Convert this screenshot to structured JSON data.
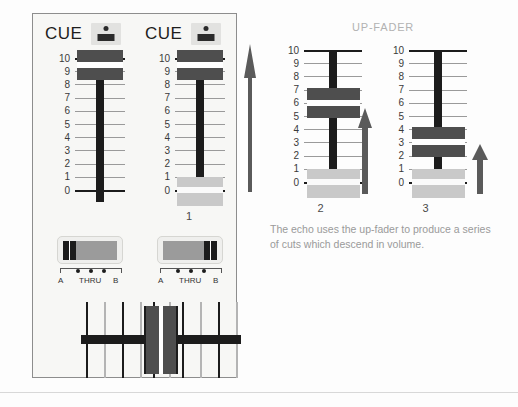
{
  "diagram": {
    "section_title": "UP-FADER",
    "caption": "The echo uses the up-fader to produce a series of cuts which descend in volume.",
    "colors": {
      "page_background": "#fdfdfd",
      "panel_background": "#f7f7f5",
      "panel_border": "#8d8d8d",
      "fader_knob": "#4e4e4e",
      "fader_stem": "#1c1c1c",
      "bottom_block": "#c9c9c9",
      "tick_line": "#9a9a9a",
      "tick_line_bold": "#1c1c1c",
      "title_text": "#b2b2b2",
      "caption_text": "#9a9a9a",
      "cue_button": "#e2e2e0",
      "selector_switch": "#9b9b9b",
      "arrow": "#5a5a5a"
    },
    "scale_labels": [
      "10",
      "9",
      "8",
      "7",
      "6",
      "5",
      "4",
      "3",
      "2",
      "1",
      "0"
    ]
  },
  "mixer": {
    "cue_channels": [
      {
        "label": "CUE",
        "button_icon": "cue-indicator-icon"
      },
      {
        "label": "CUE",
        "button_icon": "cue-indicator-icon"
      }
    ],
    "selectors": [
      {
        "left_label": "A",
        "center_label": "THRU",
        "right_label": "B",
        "position": "A"
      },
      {
        "left_label": "A",
        "center_label": "THRU",
        "right_label": "B",
        "position": "B"
      }
    ],
    "crossfader": {
      "position": "center",
      "tick_count": 10
    }
  },
  "chart_data": {
    "type": "bar",
    "title": "UP-FADER",
    "subtitle": "The echo uses the up-fader to produce a series of cuts which descend in volume.",
    "xlabel": "",
    "ylabel": "",
    "ylim": [
      0,
      10
    ],
    "grid": true,
    "legend": "none",
    "categories": [
      "",
      "1",
      "2",
      "3"
    ],
    "series": [
      {
        "name": "Fader position",
        "values": [
          9.5,
          9.5,
          6,
          3
        ]
      }
    ],
    "ticks": [
      "10",
      "9",
      "8",
      "7",
      "6",
      "5",
      "4",
      "3",
      "2",
      "1",
      "0"
    ],
    "annotations": [
      {
        "label": "arrow-full-travel",
        "near": "1",
        "height": "full"
      },
      {
        "label": "arrow-medium-travel",
        "near": "2",
        "height": "medium"
      },
      {
        "label": "arrow-short-travel",
        "near": "3",
        "height": "short"
      }
    ]
  },
  "faders": [
    {
      "caption": "",
      "value": 9.5,
      "has_bottom_block": false
    },
    {
      "caption": "1",
      "value": 9.5,
      "has_bottom_block": true
    },
    {
      "caption": "2",
      "value": 6,
      "has_bottom_block": true
    },
    {
      "caption": "3",
      "value": 3,
      "has_bottom_block": true
    }
  ]
}
